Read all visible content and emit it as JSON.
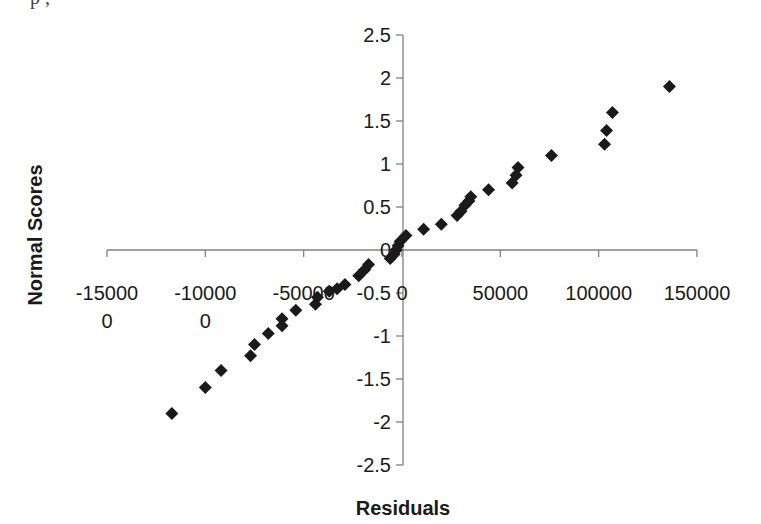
{
  "chart_data": {
    "type": "scatter",
    "title": "",
    "xlabel": "Residuals",
    "ylabel": "Normal Scores",
    "xlim": [
      -150000,
      150000
    ],
    "ylim": [
      -2.5,
      2.5
    ],
    "x_ticks": [
      -150000,
      -100000,
      -50000,
      0,
      50000,
      100000,
      150000
    ],
    "x_tick_labels": [
      "-15000\n0",
      "-10000\n0",
      "-50000",
      "0",
      "50000",
      "100000",
      "150000"
    ],
    "y_ticks": [
      2.5,
      2,
      1.5,
      1,
      0.5,
      0,
      -0.5,
      -1,
      -1.5,
      -2,
      -2.5
    ],
    "y_tick_labels": [
      "2.5",
      "2",
      "1.5",
      "1",
      "0.5",
      "0",
      "-0.5",
      "-1",
      "-1.5",
      "-2",
      "-2.5"
    ],
    "grid": false,
    "legend": null,
    "marker": "diamond",
    "marker_color": "#1a1a1a",
    "points": [
      {
        "x": -117000,
        "y": -1.9
      },
      {
        "x": -100000,
        "y": -1.6
      },
      {
        "x": -92000,
        "y": -1.4
      },
      {
        "x": -77000,
        "y": -1.23
      },
      {
        "x": -75000,
        "y": -1.1
      },
      {
        "x": -68000,
        "y": -0.97
      },
      {
        "x": -61000,
        "y": -0.88
      },
      {
        "x": -61000,
        "y": -0.8
      },
      {
        "x": -54000,
        "y": -0.7
      },
      {
        "x": -44000,
        "y": -0.63
      },
      {
        "x": -43000,
        "y": -0.55
      },
      {
        "x": -37000,
        "y": -0.48
      },
      {
        "x": -33000,
        "y": -0.45
      },
      {
        "x": -29000,
        "y": -0.4
      },
      {
        "x": -22000,
        "y": -0.3
      },
      {
        "x": -19000,
        "y": -0.23
      },
      {
        "x": -17000,
        "y": -0.17
      },
      {
        "x": -6000,
        "y": -0.1
      },
      {
        "x": -4000,
        "y": -0.05
      },
      {
        "x": -3000,
        "y": 0.0
      },
      {
        "x": -2000,
        "y": 0.05
      },
      {
        "x": -1000,
        "y": 0.1
      },
      {
        "x": 2000,
        "y": 0.17
      },
      {
        "x": 11000,
        "y": 0.24
      },
      {
        "x": 20000,
        "y": 0.3
      },
      {
        "x": 28000,
        "y": 0.4
      },
      {
        "x": 30000,
        "y": 0.45
      },
      {
        "x": 32000,
        "y": 0.52
      },
      {
        "x": 34000,
        "y": 0.57
      },
      {
        "x": 35000,
        "y": 0.62
      },
      {
        "x": 44000,
        "y": 0.7
      },
      {
        "x": 56000,
        "y": 0.78
      },
      {
        "x": 58000,
        "y": 0.87
      },
      {
        "x": 59000,
        "y": 0.96
      },
      {
        "x": 76000,
        "y": 1.1
      },
      {
        "x": 103000,
        "y": 1.23
      },
      {
        "x": 104000,
        "y": 1.39
      },
      {
        "x": 107000,
        "y": 1.6
      },
      {
        "x": 136000,
        "y": 1.9
      }
    ]
  },
  "page": {
    "partial_top_text": "p        ,"
  }
}
